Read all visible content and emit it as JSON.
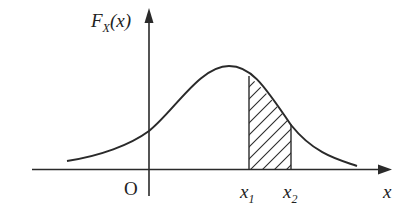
{
  "diagram": {
    "y_axis": {
      "label_main": "F",
      "label_sub": "X",
      "label_arg": "(x)"
    },
    "x_axis": {
      "label": "x"
    },
    "origin_label": "O",
    "markers": [
      {
        "main": "x",
        "sub": "1"
      },
      {
        "main": "x",
        "sub": "2"
      }
    ],
    "colors": {
      "stroke": "#2a2a2a",
      "background": "#ffffff"
    }
  }
}
